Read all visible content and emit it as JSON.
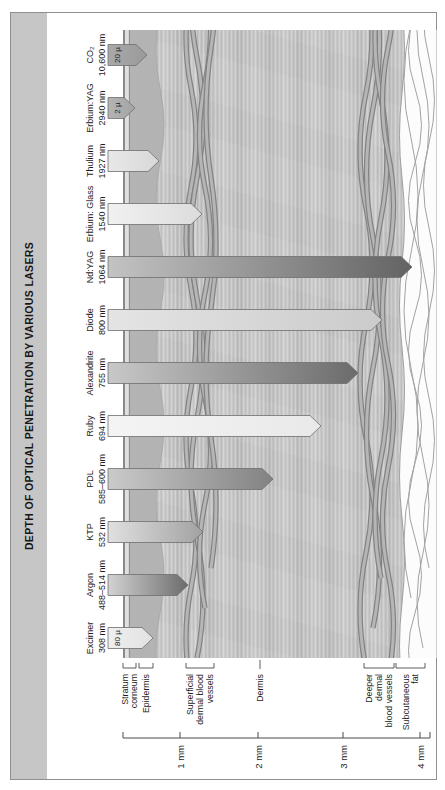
{
  "chart_data": {
    "type": "bar",
    "title": "DEPTH OF OPTICAL PENETRATION BY VARIOUS LASERS",
    "orientation": "vertical depth arrows into a skin cross-section; whole figure rotated 90 degrees counter-clockwise in the screenshot",
    "depth_unit": "mm",
    "surface_y": 123,
    "lasers": [
      {
        "name": "Excimer",
        "wavelength": "308 nm",
        "approx_depth_mm": 0.5,
        "surface_label": "80 µ",
        "tip_y": 153,
        "color_start": "#efefef",
        "color_end": "#e2e2e2"
      },
      {
        "name": "Argon",
        "wavelength": "488–514 nm",
        "approx_depth_mm": 1.1,
        "surface_label": null,
        "tip_y": 188,
        "color_start": "#d2d2d2",
        "color_end": "#6c6c6c"
      },
      {
        "name": "KTP",
        "wavelength": "532 nm",
        "approx_depth_mm": 1.3,
        "surface_label": null,
        "tip_y": 203,
        "color_start": "#e0e0e0",
        "color_end": "#a2a2a2"
      },
      {
        "name": "PDL",
        "wavelength": "585–600 nm",
        "approx_depth_mm": 2.2,
        "surface_label": null,
        "tip_y": 273,
        "color_start": "#cacaca",
        "color_end": "#828282"
      },
      {
        "name": "Ruby",
        "wavelength": "694 nm",
        "approx_depth_mm": 2.7,
        "surface_label": null,
        "tip_y": 321,
        "color_start": "#f4f4f4",
        "color_end": "#e9e9e9"
      },
      {
        "name": "Alexandrite",
        "wavelength": "755 nm",
        "approx_depth_mm": 3.2,
        "surface_label": null,
        "tip_y": 358,
        "color_start": "#c8c8c8",
        "color_end": "#6b6b6b"
      },
      {
        "name": "Diode",
        "wavelength": "800 nm",
        "approx_depth_mm": 3.5,
        "surface_label": null,
        "tip_y": 382,
        "color_start": "#e4e4e4",
        "color_end": "#cbcbcb"
      },
      {
        "name": "Nd:YAG",
        "wavelength": "1064 nm",
        "approx_depth_mm": 3.9,
        "surface_label": null,
        "tip_y": 412,
        "color_start": "#c3c3c3",
        "color_end": "#636363"
      },
      {
        "name": "Erbium: Glass",
        "wavelength": "1540 nm",
        "approx_depth_mm": 1.3,
        "surface_label": null,
        "tip_y": 202,
        "color_start": "#f1f1f1",
        "color_end": "#dcdcdc"
      },
      {
        "name": "Thulium",
        "wavelength": "1927 nm",
        "approx_depth_mm": 0.65,
        "surface_label": null,
        "tip_y": 159,
        "color_start": "#e8e8e8",
        "color_end": "#d8d8d8"
      },
      {
        "name": "Erbium:YAG",
        "wavelength": "2940 nm",
        "approx_depth_mm": 0.2,
        "surface_label": "2 µ",
        "tip_y": 135,
        "color_start": "#b4b4b4",
        "color_end": "#a4a4a4"
      },
      {
        "name": "CO₂",
        "wavelength": "10,600 nm",
        "approx_depth_mm": 0.4,
        "surface_label": "20 µ",
        "tip_y": 147,
        "color_start": "#a9a9a9",
        "color_end": "#9a9a9a"
      }
    ],
    "depth_ruler": {
      "y0": 123,
      "y1": 430,
      "ticks": [
        {
          "label": "1 mm",
          "mm": 1,
          "y": 180
        },
        {
          "label": "2 mm",
          "mm": 2,
          "y": 258
        },
        {
          "label": "3 mm",
          "mm": 3,
          "y": 343
        },
        {
          "label": "4 mm",
          "mm": 4,
          "y": 420
        }
      ]
    },
    "skin_layers": [
      {
        "label": "Stratum corneum",
        "lines": [
          "Stratum",
          "corneum"
        ],
        "style": "bracket",
        "y1": 123,
        "y2": 136
      },
      {
        "label": "Epidermis",
        "lines": [
          "Epidermis"
        ],
        "style": "bracket",
        "y1": 139,
        "y2": 153
      },
      {
        "label": "Superficial dermal blood vessels",
        "lines": [
          "Superficial",
          "dermal blood",
          "vessels"
        ],
        "style": "bracket",
        "y1": 186,
        "y2": 214
      },
      {
        "label": "Dermis",
        "lines": [
          "Dermis"
        ],
        "style": "tick",
        "y1": 258,
        "y2": 262
      },
      {
        "label": "Deeper dermal blood vessels",
        "lines": [
          "Deeper",
          "dermal",
          "blood vessels"
        ],
        "style": "bracket",
        "y1": 364,
        "y2": 394
      },
      {
        "label": "Subcutaneous fat",
        "lines": [
          "Subcutaneous",
          "fat"
        ],
        "style": "bracket",
        "y1": 396,
        "y2": 425
      }
    ]
  },
  "colors": {
    "title_bar": "#c6c6c6",
    "title_text": "#161616",
    "frame_border": "#8f8f8f",
    "dermis": "#c8c8c8",
    "epidermis": "#b2b2b2",
    "stratum_corneum_fill": "#e0e0e0",
    "vessel_outline": "#828282",
    "vessel_fill": "#b6b6b6",
    "fat_fill": "#fcfcfc",
    "fat_outline": "#9e9e9e",
    "arrow_outline": "#6f6f6f",
    "axis": "#4a4a4a"
  }
}
